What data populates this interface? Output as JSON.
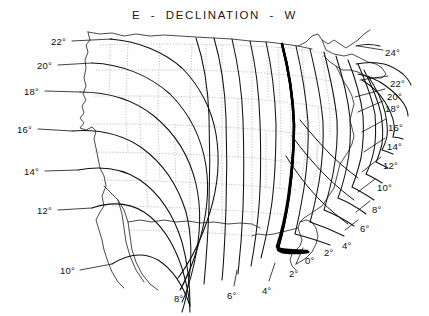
{
  "chart": {
    "title": "E  -  DECLINATION  -  W",
    "line_color": "#111111",
    "boundary_color": "#8a8a8a",
    "agonic_color": "#000000",
    "background_color": "#fefefe"
  },
  "chart_data": {
    "type": "line",
    "title": "E  -  DECLINATION  -  W",
    "xlabel": "",
    "ylabel": "",
    "grid": false,
    "legend": "none",
    "units": "degrees",
    "agonic_value": "0°",
    "contour_values_east": [
      "2°",
      "4°",
      "6°",
      "8°",
      "10°",
      "12°",
      "14°",
      "16°",
      "18°",
      "20°",
      "22°"
    ],
    "contour_values_west": [
      "2°",
      "4°",
      "6°",
      "8°",
      "10°",
      "12°",
      "14°",
      "16°",
      "18°",
      "20°",
      "22°",
      "24°"
    ],
    "labels": [
      {
        "id": "left-22",
        "text": "22°",
        "x": 51,
        "y": 36,
        "side": "left"
      },
      {
        "id": "left-20",
        "text": "20°",
        "x": 37,
        "y": 60,
        "side": "left"
      },
      {
        "id": "left-18",
        "text": "18°",
        "x": 24,
        "y": 86,
        "side": "left"
      },
      {
        "id": "left-16",
        "text": "16°",
        "x": 17,
        "y": 124,
        "side": "left"
      },
      {
        "id": "left-14",
        "text": "14°",
        "x": 24,
        "y": 166,
        "side": "left"
      },
      {
        "id": "left-12",
        "text": "12°",
        "x": 37,
        "y": 205,
        "side": "left"
      },
      {
        "id": "left-10",
        "text": "10°",
        "x": 60,
        "y": 265,
        "side": "left"
      },
      {
        "id": "bot-8",
        "text": "8°",
        "x": 174,
        "y": 293,
        "side": "bottom"
      },
      {
        "id": "bot-6",
        "text": "6°",
        "x": 227,
        "y": 290,
        "side": "bottom"
      },
      {
        "id": "bot-4",
        "text": "4°",
        "x": 262,
        "y": 285,
        "side": "bottom"
      },
      {
        "id": "bot-2",
        "text": "2°",
        "x": 289,
        "y": 268,
        "side": "bottom"
      },
      {
        "id": "bot-0",
        "text": "0°",
        "x": 305,
        "y": 255,
        "side": "bottom"
      },
      {
        "id": "bot-w2",
        "text": "2°",
        "x": 324,
        "y": 247,
        "side": "bottom"
      },
      {
        "id": "bot-w4",
        "text": "4°",
        "x": 342,
        "y": 240,
        "side": "bottom"
      },
      {
        "id": "right-6",
        "text": "6°",
        "x": 360,
        "y": 223,
        "side": "right"
      },
      {
        "id": "right-8",
        "text": "8°",
        "x": 372,
        "y": 204,
        "side": "right"
      },
      {
        "id": "right-10",
        "text": "10°",
        "x": 377,
        "y": 182,
        "side": "right"
      },
      {
        "id": "right-12",
        "text": "12°",
        "x": 383,
        "y": 160,
        "side": "right"
      },
      {
        "id": "right-14",
        "text": "14°",
        "x": 387,
        "y": 141,
        "side": "right"
      },
      {
        "id": "right-16",
        "text": "16°",
        "x": 388,
        "y": 122,
        "side": "right"
      },
      {
        "id": "right-18",
        "text": "18°",
        "x": 385,
        "y": 103,
        "side": "right"
      },
      {
        "id": "right-20",
        "text": "20°",
        "x": 387,
        "y": 91,
        "side": "right"
      },
      {
        "id": "right-22",
        "text": "22°",
        "x": 390,
        "y": 78,
        "side": "right"
      },
      {
        "id": "right-24",
        "text": "24°",
        "x": 385,
        "y": 47,
        "side": "right"
      }
    ],
    "leader_lines": [
      {
        "id": "lead-22L",
        "x1": 72,
        "y1": 41,
        "x2": 112,
        "y2": 39
      },
      {
        "id": "lead-20L",
        "x1": 58,
        "y1": 65,
        "x2": 92,
        "y2": 63
      },
      {
        "id": "lead-18L",
        "x1": 45,
        "y1": 91,
        "x2": 80,
        "y2": 92
      },
      {
        "id": "lead-16L",
        "x1": 38,
        "y1": 129,
        "x2": 72,
        "y2": 131
      },
      {
        "id": "lead-14L",
        "x1": 45,
        "y1": 171,
        "x2": 78,
        "y2": 170
      },
      {
        "id": "lead-12L",
        "x1": 58,
        "y1": 210,
        "x2": 92,
        "y2": 208
      },
      {
        "id": "lead-10L",
        "x1": 80,
        "y1": 270,
        "x2": 112,
        "y2": 264
      },
      {
        "id": "lead-8B",
        "x1": 181,
        "y1": 289,
        "x2": 188,
        "y2": 273
      },
      {
        "id": "lead-6B",
        "x1": 234,
        "y1": 286,
        "x2": 237,
        "y2": 270
      },
      {
        "id": "lead-4B",
        "x1": 269,
        "y1": 281,
        "x2": 275,
        "y2": 263
      },
      {
        "id": "lead-2B",
        "x1": 296,
        "y1": 264,
        "x2": 303,
        "y2": 248
      },
      {
        "id": "lead-6R",
        "x1": 358,
        "y1": 220,
        "x2": 345,
        "y2": 230
      },
      {
        "id": "lead-8R",
        "x1": 370,
        "y1": 201,
        "x2": 356,
        "y2": 212
      },
      {
        "id": "lead-10R",
        "x1": 375,
        "y1": 179,
        "x2": 358,
        "y2": 192
      },
      {
        "id": "lead-12R",
        "x1": 381,
        "y1": 157,
        "x2": 362,
        "y2": 172
      },
      {
        "id": "lead-14R",
        "x1": 385,
        "y1": 138,
        "x2": 364,
        "y2": 152
      },
      {
        "id": "lead-16R",
        "x1": 386,
        "y1": 119,
        "x2": 362,
        "y2": 132
      },
      {
        "id": "lead-18R",
        "x1": 383,
        "y1": 101,
        "x2": 358,
        "y2": 112
      },
      {
        "id": "lead-20R",
        "x1": 385,
        "y1": 89,
        "x2": 355,
        "y2": 97
      },
      {
        "id": "lead-22R",
        "x1": 388,
        "y1": 76,
        "x2": 360,
        "y2": 80
      },
      {
        "id": "lead-24R",
        "x1": 383,
        "y1": 50,
        "x2": 358,
        "y2": 46
      }
    ]
  }
}
